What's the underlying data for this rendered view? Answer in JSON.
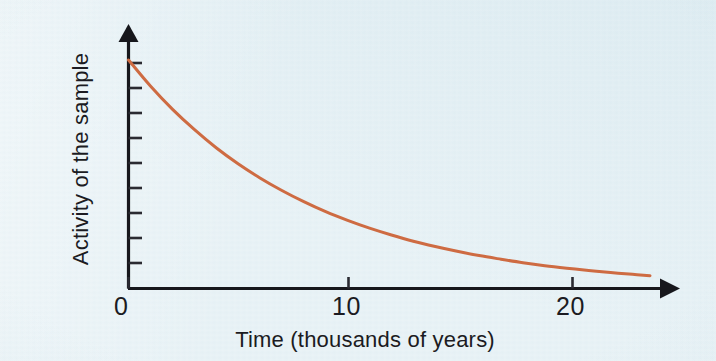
{
  "figure": {
    "background_color": "#e7f1f5",
    "curve_color": "#ce6b42",
    "axis_color": "#17171c"
  },
  "chart_data": {
    "type": "line",
    "title": "",
    "subtitle": "",
    "xlabel": "Time (thousands of years)",
    "ylabel": "Activity of the sample",
    "xlim": [
      0,
      23.8
    ],
    "ylim": [
      0,
      1.08
    ],
    "grid": false,
    "legend": null,
    "x_ticks": [
      0,
      10,
      20
    ],
    "x_tick_labels": [
      "0",
      "10",
      "20"
    ],
    "y_ticks": [],
    "y_tick_labels": [],
    "y_minor_tick_count": 9,
    "annotations": [],
    "series": [
      {
        "name": "Radioactive decay",
        "model": "exponential decay",
        "half_life_thousands_of_years": 5.73,
        "x": [
          0,
          1,
          2,
          3,
          4,
          5,
          6,
          7,
          8,
          9,
          10,
          11,
          12,
          13,
          14,
          15,
          16,
          17,
          18,
          19,
          20,
          21,
          22,
          23,
          23.8
        ],
        "values": [
          1.0,
          0.886,
          0.785,
          0.696,
          0.616,
          0.546,
          0.484,
          0.429,
          0.38,
          0.336,
          0.298,
          0.264,
          0.234,
          0.207,
          0.184,
          0.163,
          0.144,
          0.128,
          0.113,
          0.1,
          0.089,
          0.079,
          0.07,
          0.062,
          0.056
        ]
      }
    ]
  },
  "labels": {
    "x_tick_0": "0",
    "x_tick_10": "10",
    "x_tick_20": "20",
    "x_axis_title": "Time (thousands of years)",
    "y_axis_title": "Activity of the sample"
  }
}
